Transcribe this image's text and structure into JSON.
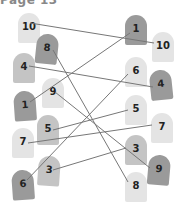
{
  "page": {
    "title": "Page 13"
  },
  "colors": {
    "light": "#e4e4e4",
    "mid": "#c4c4c4",
    "dark": "#9a9a9a",
    "line": "#777777"
  },
  "left_stones": [
    {
      "label": "10",
      "x": 18,
      "y": 13,
      "shade": "light",
      "rot": 0
    },
    {
      "label": "8",
      "x": 36,
      "y": 34,
      "shade": "dark",
      "rot": 6
    },
    {
      "label": "4",
      "x": 13,
      "y": 53,
      "shade": "mid",
      "rot": 0
    },
    {
      "label": "9",
      "x": 42,
      "y": 78,
      "shade": "light",
      "rot": 0
    },
    {
      "label": "1",
      "x": 14,
      "y": 91,
      "shade": "dark",
      "rot": -4
    },
    {
      "label": "5",
      "x": 37,
      "y": 115,
      "shade": "mid",
      "rot": 0
    },
    {
      "label": "7",
      "x": 12,
      "y": 128,
      "shade": "light",
      "rot": 0
    },
    {
      "label": "3",
      "x": 38,
      "y": 156,
      "shade": "mid",
      "rot": 4
    },
    {
      "label": "6",
      "x": 12,
      "y": 170,
      "shade": "dark",
      "rot": -4
    }
  ],
  "right_stones": [
    {
      "label": "1",
      "x": 125,
      "y": 15,
      "shade": "dark",
      "rot": 0
    },
    {
      "label": "10",
      "x": 152,
      "y": 32,
      "shade": "light",
      "rot": 0,
      "outside": true
    },
    {
      "label": "6",
      "x": 125,
      "y": 57,
      "shade": "light",
      "rot": 0
    },
    {
      "label": "4",
      "x": 150,
      "y": 70,
      "shade": "dark",
      "rot": -6
    },
    {
      "label": "5",
      "x": 125,
      "y": 95,
      "shade": "light",
      "rot": 0
    },
    {
      "label": "7",
      "x": 151,
      "y": 113,
      "shade": "light",
      "rot": 0
    },
    {
      "label": "3",
      "x": 125,
      "y": 135,
      "shade": "mid",
      "rot": 0
    },
    {
      "label": "9",
      "x": 148,
      "y": 155,
      "shade": "dark",
      "rot": 5
    },
    {
      "label": "8",
      "x": 125,
      "y": 172,
      "shade": "light",
      "rot": 0
    }
  ],
  "connections": [
    {
      "label": "10",
      "x1": 30,
      "y1": 23,
      "x2": 154,
      "y2": 43
    },
    {
      "label": "8",
      "x1": 53,
      "y1": 50,
      "x2": 128,
      "y2": 182
    },
    {
      "label": "4",
      "x1": 29,
      "y1": 66,
      "x2": 153,
      "y2": 87
    },
    {
      "label": "1",
      "x1": 30,
      "y1": 102,
      "x2": 130,
      "y2": 33
    },
    {
      "label": "9",
      "x1": 55,
      "y1": 92,
      "x2": 150,
      "y2": 168
    },
    {
      "label": "5",
      "x1": 53,
      "y1": 130,
      "x2": 128,
      "y2": 110
    },
    {
      "label": "7",
      "x1": 28,
      "y1": 143,
      "x2": 152,
      "y2": 125
    },
    {
      "label": "3",
      "x1": 53,
      "y1": 170,
      "x2": 126,
      "y2": 148
    },
    {
      "label": "6",
      "x1": 27,
      "y1": 180,
      "x2": 128,
      "y2": 74
    }
  ]
}
